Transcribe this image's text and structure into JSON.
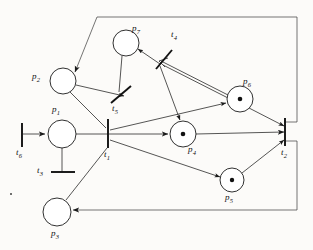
{
  "figure": {
    "kind": "petri-net-diagram",
    "background_color": "#fcfbf9",
    "ink_color": "#1a1a1a"
  },
  "places": [
    {
      "id": "p1",
      "label": "p",
      "sub": "1",
      "cx": 62,
      "cy": 133,
      "r": 14,
      "tokens": 0,
      "label_x": 52,
      "label_y": 108
    },
    {
      "id": "p2",
      "label": "p",
      "sub": "2",
      "cx": 63,
      "cy": 81,
      "r": 13,
      "tokens": 0,
      "label_x": 32,
      "label_y": 76
    },
    {
      "id": "p3",
      "label": "p",
      "sub": "3",
      "cx": 57,
      "cy": 212,
      "r": 14,
      "tokens": 0,
      "label_x": 52,
      "label_y": 231
    },
    {
      "id": "p4",
      "label": "p",
      "sub": "4",
      "cx": 183,
      "cy": 134,
      "r": 13,
      "tokens": 1,
      "label_x": 188,
      "label_y": 147
    },
    {
      "id": "p5",
      "label": "p",
      "sub": "5",
      "cx": 232,
      "cy": 180,
      "r": 12,
      "tokens": 1,
      "label_x": 226,
      "label_y": 194
    },
    {
      "id": "p6",
      "label": "p",
      "sub": "6",
      "cx": 240,
      "cy": 99,
      "r": 13,
      "tokens": 1,
      "label_x": 243,
      "label_y": 80
    },
    {
      "id": "p7",
      "label": "p",
      "sub": "7",
      "cx": 126,
      "cy": 43,
      "r": 13,
      "tokens": 0,
      "label_x": 133,
      "label_y": 27
    }
  ],
  "transitions": [
    {
      "id": "t1",
      "label": "t",
      "sub": "1",
      "x1": 108,
      "y1": 119,
      "x2": 108,
      "y2": 147,
      "label_x": 104,
      "label_y": 149
    },
    {
      "id": "t2",
      "label": "t",
      "sub": "2",
      "x1": 285,
      "y1": 119,
      "x2": 285,
      "y2": 145,
      "label_x": 282,
      "label_y": 147
    },
    {
      "id": "t3",
      "label": "t",
      "sub": "3",
      "x1": 52,
      "y1": 172,
      "x2": 74,
      "y2": 172,
      "label_x": 39,
      "label_y": 168
    },
    {
      "id": "t4",
      "label": "t",
      "sub": "4",
      "x1": 156,
      "y1": 68,
      "x2": 172,
      "y2": 51,
      "label_x": 172,
      "label_y": 32
    },
    {
      "id": "t5",
      "label": "t",
      "sub": "5",
      "x1": 112,
      "y1": 102,
      "x2": 132,
      "y2": 87,
      "label_x": 113,
      "label_y": 104
    },
    {
      "id": "t6",
      "label": "t",
      "sub": "6",
      "x1": 22,
      "y1": 124,
      "x2": 22,
      "y2": 146,
      "label_x": 17,
      "label_y": 148
    }
  ],
  "arcs": [
    {
      "name": "t6-to-p1",
      "from": "t6",
      "to": "p1",
      "style": "single",
      "arrow": true
    },
    {
      "name": "p1-to-t1",
      "from": "p1",
      "to": "t1",
      "style": "single",
      "arrow": false
    },
    {
      "name": "p1-to-t3",
      "from": "p1",
      "to": "t3",
      "style": "single",
      "arrow": false
    },
    {
      "name": "p2-to-t1",
      "from": "p2",
      "to": "t1",
      "style": "single",
      "arrow": false
    },
    {
      "name": "p2-to-t5",
      "from": "p2",
      "to": "t5",
      "style": "single",
      "arrow": true
    },
    {
      "name": "t1-to-p4",
      "from": "t1",
      "to": "p4",
      "style": "single",
      "arrow": true
    },
    {
      "name": "t1-to-p6",
      "from": "t1",
      "to": "p6",
      "style": "single",
      "arrow": true
    },
    {
      "name": "t1-to-p5",
      "from": "t1",
      "to": "p5",
      "style": "single",
      "arrow": true
    },
    {
      "name": "p3-to-t1",
      "from": "p3",
      "to": "t1",
      "style": "single",
      "arrow": false
    },
    {
      "name": "p4-to-t2",
      "from": "p4",
      "to": "t2",
      "style": "single",
      "arrow": true
    },
    {
      "name": "p5-to-t2",
      "from": "p5",
      "to": "t2",
      "style": "single",
      "arrow": true
    },
    {
      "name": "p6-to-t2",
      "from": "p6",
      "to": "t2",
      "style": "single",
      "arrow": true
    },
    {
      "name": "t4-to-p7",
      "from": "t4",
      "to": "p7",
      "style": "single",
      "arrow": true
    },
    {
      "name": "t4-to-p4",
      "from": "t4",
      "to": "p4",
      "style": "single",
      "arrow": true
    },
    {
      "name": "p7-to-t5",
      "from": "p7",
      "to": "t5",
      "style": "single",
      "arrow": false
    },
    {
      "name": "p6-t4-double",
      "from": "p6",
      "to": "t4",
      "style": "double",
      "arrow": true
    },
    {
      "name": "t2-to-p2-return",
      "from": "t2",
      "to": "p2",
      "style": "border",
      "arrow": true
    },
    {
      "name": "t2-to-p3-return",
      "from": "t2",
      "to": "p3",
      "style": "border",
      "arrow": true
    }
  ],
  "labels": [
    {
      "name": "label-p1",
      "text": "p",
      "sub": "1"
    },
    {
      "name": "label-p2",
      "text": "p",
      "sub": "2"
    },
    {
      "name": "label-p3",
      "text": "p",
      "sub": "3"
    },
    {
      "name": "label-p4",
      "text": "p",
      "sub": "4"
    },
    {
      "name": "label-p5",
      "text": "p",
      "sub": "5"
    },
    {
      "name": "label-p6",
      "text": "p",
      "sub": "6"
    },
    {
      "name": "label-p7",
      "text": "p",
      "sub": "7"
    },
    {
      "name": "label-t1",
      "text": "t",
      "sub": "1"
    },
    {
      "name": "label-t2",
      "text": "t",
      "sub": "2"
    },
    {
      "name": "label-t3",
      "text": "t",
      "sub": "3"
    },
    {
      "name": "label-t4",
      "text": "t",
      "sub": "4"
    },
    {
      "name": "label-t5",
      "text": "t",
      "sub": "5"
    },
    {
      "name": "label-t6",
      "text": "t",
      "sub": "6"
    }
  ]
}
